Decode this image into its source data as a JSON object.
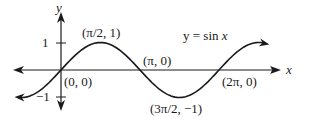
{
  "chart_data": {
    "type": "line",
    "title": "y = sin x",
    "xlabel": "x",
    "ylabel": "y",
    "function": "sin(x)",
    "x_range": [
      -0.55,
      2.6
    ],
    "x_range_units": "pi",
    "ylim": [
      -1,
      1
    ],
    "y_ticks": [
      {
        "value": 1,
        "label": "1"
      },
      {
        "value": -1,
        "label": "−1"
      }
    ],
    "grid": false,
    "legend": null,
    "series": [
      {
        "name": "y = sin x",
        "x": [
          0,
          0.5,
          1,
          1.5,
          2
        ],
        "x_units": "pi",
        "values": [
          0,
          1,
          0,
          -1,
          0
        ]
      }
    ],
    "annotations": [
      {
        "text": "(0, 0)",
        "x": 0,
        "y": 0
      },
      {
        "text": "(π/2, 1)",
        "x": 1.5708,
        "y": 1
      },
      {
        "text": "(π, 0)",
        "x": 3.1416,
        "y": 0
      },
      {
        "text": "(3π/2, −1)",
        "x": 4.7124,
        "y": -1
      },
      {
        "text": "(2π, 0)",
        "x": 6.2832,
        "y": 0
      }
    ]
  },
  "labels": {
    "y_axis": "y",
    "x_axis": "x",
    "tick_pos": "1",
    "tick_neg": "−1",
    "equation_prefix": "y = sin ",
    "equation_var": "x",
    "pt_origin": "(0, 0)",
    "pt_max": "(π/2, 1)",
    "pt_pi": "(π, 0)",
    "pt_min": "(3π/2, −1)",
    "pt_2pi": "(2π, 0)"
  },
  "colors": {
    "ink": "#1a1a1a",
    "background": "#ffffff"
  }
}
